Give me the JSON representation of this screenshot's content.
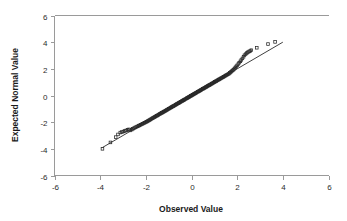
{
  "chart_data": {
    "type": "scatter",
    "title": "",
    "xlabel": "Observed Value",
    "ylabel": "Expected Normal Value",
    "xlim": [
      -6,
      6
    ],
    "ylim": [
      -6,
      6
    ],
    "xticks": [
      -6,
      -4,
      -2,
      0,
      2,
      4,
      6
    ],
    "yticks": [
      -6,
      -4,
      -2,
      0,
      2,
      4,
      6
    ],
    "xtick_labels": [
      "-6",
      "-4",
      "-2",
      "0",
      "2",
      "4",
      "6"
    ],
    "ytick_labels": [
      "-6",
      "-4",
      "-2",
      "0",
      "2",
      "4",
      "6"
    ],
    "grid": false,
    "legend": null,
    "marker": "open-square",
    "marker_color": "#262626",
    "reference_line": {
      "label": "normal reference line",
      "color": "#2a2a2a",
      "x": [
        -3.9,
        4.0
      ],
      "y": [
        -3.9,
        4.0
      ]
    },
    "series": [
      {
        "name": "Q-Q points",
        "x": [
          -3.9,
          -3.55,
          -3.32,
          -3.22,
          -3.12,
          -3.05,
          -2.98,
          -2.92,
          -2.86,
          -2.8,
          -2.74,
          -2.68,
          -2.62,
          -2.57,
          -2.52,
          -2.47,
          -2.42,
          -2.37,
          -2.32,
          -2.28,
          -2.23,
          -2.18,
          -2.14,
          -2.09,
          -2.05,
          -2.0,
          -1.96,
          -1.92,
          -1.88,
          -1.84,
          -1.8,
          -1.76,
          -1.72,
          -1.68,
          -1.64,
          -1.6,
          -1.56,
          -1.52,
          -1.49,
          -1.45,
          -1.41,
          -1.38,
          -1.34,
          -1.3,
          -1.27,
          -1.23,
          -1.2,
          -1.16,
          -1.13,
          -1.09,
          -1.06,
          -1.02,
          -0.99,
          -0.96,
          -0.92,
          -0.89,
          -0.86,
          -0.82,
          -0.79,
          -0.76,
          -0.72,
          -0.69,
          -0.66,
          -0.63,
          -0.59,
          -0.56,
          -0.53,
          -0.5,
          -0.47,
          -0.43,
          -0.4,
          -0.37,
          -0.34,
          -0.31,
          -0.28,
          -0.24,
          -0.21,
          -0.18,
          -0.15,
          -0.12,
          -0.09,
          -0.06,
          -0.03,
          0.0,
          0.03,
          0.06,
          0.09,
          0.12,
          0.15,
          0.18,
          0.21,
          0.24,
          0.28,
          0.31,
          0.34,
          0.37,
          0.4,
          0.43,
          0.47,
          0.5,
          0.53,
          0.56,
          0.59,
          0.63,
          0.66,
          0.69,
          0.72,
          0.76,
          0.79,
          0.82,
          0.86,
          0.89,
          0.92,
          0.96,
          0.99,
          1.02,
          1.06,
          1.09,
          1.13,
          1.16,
          1.2,
          1.23,
          1.27,
          1.3,
          1.34,
          1.38,
          1.41,
          1.45,
          1.49,
          1.52,
          1.56,
          1.6,
          1.64,
          1.68,
          1.72,
          1.76,
          1.8,
          1.84,
          1.88,
          1.92,
          1.96,
          2.0,
          2.05,
          2.09,
          2.14,
          2.18,
          2.23,
          2.28,
          2.32,
          2.37,
          2.42,
          2.47,
          2.52,
          2.57,
          2.62,
          2.86,
          3.35,
          3.66
        ],
        "y": [
          -4.0,
          -3.52,
          -3.12,
          -2.92,
          -2.78,
          -2.74,
          -2.7,
          -2.66,
          -2.62,
          -2.58,
          -2.54,
          -2.62,
          -2.56,
          -2.5,
          -2.45,
          -2.4,
          -2.36,
          -2.32,
          -2.28,
          -2.24,
          -2.2,
          -2.16,
          -2.12,
          -2.08,
          -2.04,
          -2.0,
          -1.96,
          -1.92,
          -1.88,
          -1.84,
          -1.8,
          -1.76,
          -1.72,
          -1.68,
          -1.64,
          -1.6,
          -1.56,
          -1.52,
          -1.49,
          -1.45,
          -1.41,
          -1.38,
          -1.34,
          -1.3,
          -1.27,
          -1.23,
          -1.2,
          -1.16,
          -1.13,
          -1.09,
          -1.06,
          -1.02,
          -0.99,
          -0.96,
          -0.92,
          -0.89,
          -0.86,
          -0.82,
          -0.79,
          -0.76,
          -0.72,
          -0.69,
          -0.66,
          -0.63,
          -0.59,
          -0.56,
          -0.53,
          -0.5,
          -0.47,
          -0.43,
          -0.4,
          -0.37,
          -0.34,
          -0.31,
          -0.28,
          -0.24,
          -0.21,
          -0.18,
          -0.15,
          -0.12,
          -0.09,
          -0.06,
          -0.03,
          0.0,
          0.03,
          0.06,
          0.09,
          0.12,
          0.15,
          0.18,
          0.21,
          0.24,
          0.28,
          0.31,
          0.34,
          0.37,
          0.4,
          0.43,
          0.47,
          0.5,
          0.53,
          0.56,
          0.59,
          0.63,
          0.66,
          0.69,
          0.72,
          0.76,
          0.79,
          0.82,
          0.86,
          0.89,
          0.92,
          0.96,
          0.99,
          1.02,
          1.06,
          1.09,
          1.13,
          1.16,
          1.2,
          1.23,
          1.27,
          1.3,
          1.34,
          1.38,
          1.41,
          1.45,
          1.49,
          1.52,
          1.56,
          1.6,
          1.64,
          1.7,
          1.76,
          1.82,
          1.88,
          1.94,
          2.02,
          2.1,
          2.18,
          2.26,
          2.36,
          2.46,
          2.56,
          2.66,
          2.78,
          2.9,
          3.02,
          3.1,
          3.18,
          3.24,
          3.3,
          3.34,
          3.4,
          3.58,
          3.86,
          4.02
        ]
      }
    ]
  },
  "axes": {
    "x_title": "Observed Value",
    "y_title": "Expected Normal Value"
  }
}
